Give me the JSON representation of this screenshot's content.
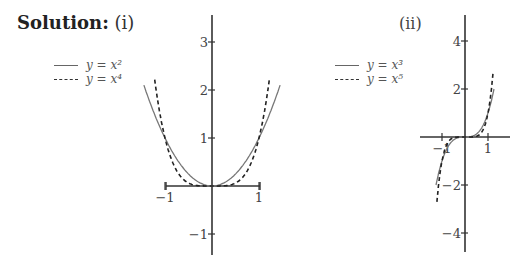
{
  "header": {
    "solution_label": "Solution:",
    "part_i": "(i)",
    "part_ii": "(ii)"
  },
  "legend_i": [
    {
      "label": "y = x²",
      "style": "solid"
    },
    {
      "label": "y = x⁴",
      "style": "dashed"
    }
  ],
  "legend_ii": [
    {
      "label": "y = x³",
      "style": "solid"
    },
    {
      "label": "y = x⁵",
      "style": "dashed"
    }
  ],
  "chart_data": [
    {
      "type": "line",
      "title": "(i)",
      "xlabel": "",
      "ylabel": "",
      "xticks": [
        -1,
        1
      ],
      "yticks": [
        -1,
        1,
        2,
        3
      ],
      "xlim": [
        -1.5,
        1.5
      ],
      "ylim": [
        -1.5,
        3.6
      ],
      "series": [
        {
          "name": "y = x^2",
          "style": "solid",
          "x": [
            -1.45,
            -1.2,
            -1,
            -0.8,
            -0.6,
            -0.4,
            -0.2,
            0,
            0.2,
            0.4,
            0.6,
            0.8,
            1,
            1.2,
            1.45
          ],
          "values": [
            2.1,
            1.44,
            1,
            0.64,
            0.36,
            0.16,
            0.04,
            0,
            0.04,
            0.16,
            0.36,
            0.64,
            1,
            1.44,
            2.1
          ]
        },
        {
          "name": "y = x^4",
          "style": "dashed",
          "x": [
            -1.22,
            -1.1,
            -1,
            -0.8,
            -0.6,
            -0.4,
            -0.2,
            0,
            0.2,
            0.4,
            0.6,
            0.8,
            1,
            1.1,
            1.22
          ],
          "values": [
            2.2,
            1.46,
            1,
            0.41,
            0.13,
            0.03,
            0,
            0,
            0,
            0.03,
            0.13,
            0.41,
            1,
            1.46,
            2.2
          ]
        }
      ],
      "legend_position": "upper left"
    },
    {
      "type": "line",
      "title": "(ii)",
      "xlabel": "",
      "ylabel": "",
      "xticks": [
        -1,
        1
      ],
      "yticks": [
        -4,
        -2,
        2,
        4
      ],
      "xlim": [
        -2,
        2
      ],
      "ylim": [
        -5,
        5
      ],
      "series": [
        {
          "name": "y = x^3",
          "style": "solid",
          "x": [
            -1.26,
            -1,
            -0.8,
            -0.5,
            0,
            0.5,
            0.8,
            1,
            1.26
          ],
          "values": [
            -2,
            -1,
            -0.51,
            -0.13,
            0,
            0.13,
            0.51,
            1,
            2
          ]
        },
        {
          "name": "y = x^5",
          "style": "dashed",
          "x": [
            -1.22,
            -1.1,
            -1,
            -0.8,
            -0.5,
            0,
            0.5,
            0.8,
            1,
            1.1,
            1.22
          ],
          "values": [
            -2.7,
            -1.61,
            -1,
            -0.33,
            -0.03,
            0,
            0.03,
            0.33,
            1,
            1.61,
            2.7
          ]
        }
      ],
      "legend_position": "upper left"
    }
  ]
}
